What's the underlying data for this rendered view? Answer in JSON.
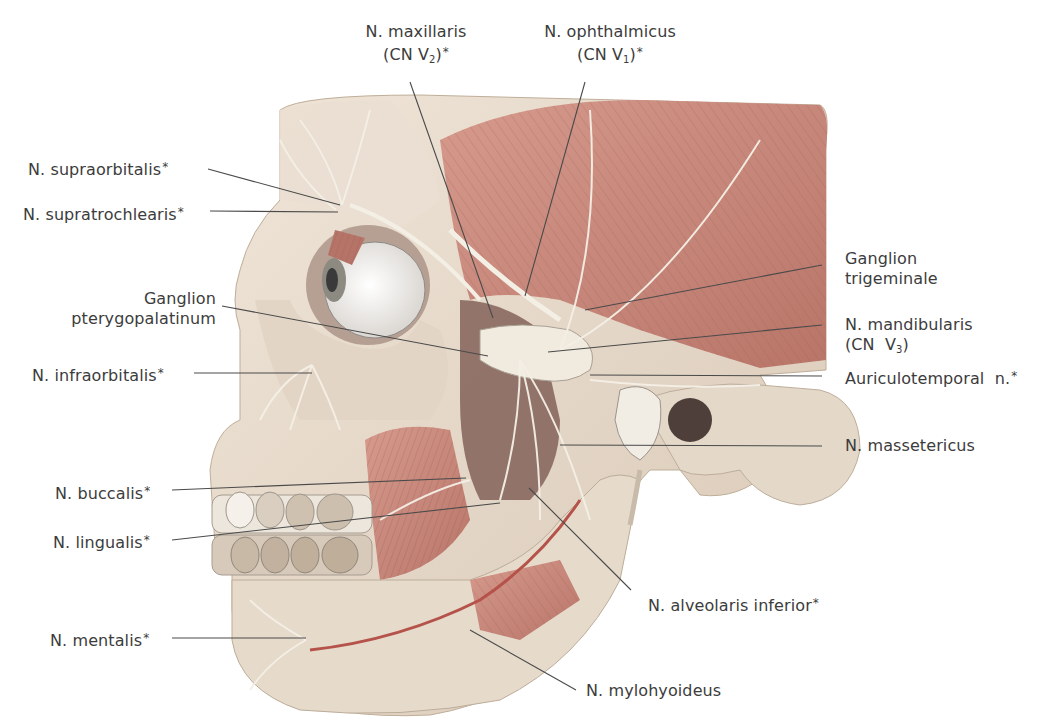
{
  "figure": {
    "colors": {
      "background": "#ffffff",
      "label_text": "#3c3c3c",
      "leader_line": "#4a4a4a",
      "bone": "#e8dccd",
      "muscle": "#c98a7e",
      "muscle_dark": "#a8685e",
      "nerve": "#f4efe4",
      "artery": "#b5524a"
    }
  },
  "labels": {
    "maxillaris": {
      "name": "N. maxillaris",
      "sub_prefix": "(CN V",
      "sub": "2",
      "sub_suffix": ")",
      "asterisk": "*"
    },
    "ophthalmicus": {
      "name": "N. ophthalmicus",
      "sub_prefix": "(CN V",
      "sub": "1",
      "sub_suffix": ")",
      "asterisk": "*"
    },
    "supraorbitalis": {
      "name": "N. supraorbitalis",
      "asterisk": "*"
    },
    "supratrochlearis": {
      "name": "N. supratrochlearis",
      "asterisk": "*"
    },
    "ganglion_pterygopalatinum": {
      "line1": "Ganglion",
      "line2": "pterygopalatinum"
    },
    "infraorbitalis": {
      "name": "N. infraorbitalis",
      "asterisk": "*"
    },
    "buccalis": {
      "name": "N. buccalis",
      "asterisk": "*"
    },
    "lingualis": {
      "name": "N. lingualis",
      "asterisk": "*"
    },
    "mentalis": {
      "name": "N. mentalis",
      "asterisk": "*"
    },
    "ganglion_trigeminale": {
      "line1": "Ganglion",
      "line2": "trigeminale"
    },
    "mandibularis": {
      "name": "N. mandibularis",
      "sub_prefix": "(CN  V",
      "sub": "3",
      "sub_suffix": ")"
    },
    "auriculotemporal": {
      "name": "Auriculotemporal  n.",
      "asterisk": "*"
    },
    "massetericus": {
      "name": "N. massetericus"
    },
    "alveolaris_inferior": {
      "name": "N. alveolaris inferior",
      "asterisk": "*"
    },
    "mylohyoideus": {
      "name": "N. mylohyoideus"
    }
  }
}
